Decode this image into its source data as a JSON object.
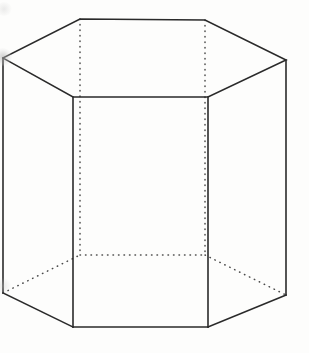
{
  "figure": {
    "background_color": "#fdfdfc",
    "solid_line_color": "#2a2a2a",
    "hidden_line_color": "#4a4a4a",
    "solid_line_width": 1.6,
    "hidden_line_width": 1.5,
    "hidden_dash_pattern": "0.5 5",
    "canvas": {
      "width": 309,
      "height": 353
    },
    "vertices": {
      "top_left_far": [
        3,
        58
      ],
      "top_back_left": [
        80,
        19
      ],
      "top_back_right": [
        205,
        20
      ],
      "top_right_far": [
        286,
        60
      ],
      "top_front_right": [
        208,
        97
      ],
      "top_front_left": [
        73,
        97
      ],
      "bottom_left_far": [
        3,
        293
      ],
      "bottom_back_left": [
        80,
        255
      ],
      "bottom_back_right": [
        205,
        255
      ],
      "bottom_right_far": [
        286,
        295
      ],
      "bottom_front_right": [
        208,
        327
      ],
      "bottom_front_left": [
        73,
        327
      ]
    },
    "edges": {
      "top_face_solid": "3,58 80,19 205,20 286,60 208,97 73,97 3,58",
      "bottom_front_solid": "73,327 208,327",
      "bottom_left_solid": "3,293 73,327",
      "bottom_right_solid": "208,327 286,295",
      "vertical_left_far_solid": "3,58 3,293",
      "vertical_front_left_solid": "73,97 73,327",
      "vertical_front_right_solid": "208,97 208,327",
      "vertical_right_far_solid": "286,60 286,295",
      "vertical_back_left_hidden": "80,19 80,255",
      "vertical_back_right_hidden": "205,20 205,255",
      "bottom_back_edge_hidden": "80,255 205,255",
      "bottom_back_left_diag_hidden": "3,293 80,255",
      "bottom_back_right_diag_hidden": "205,255 286,295"
    },
    "artifacts": [
      {
        "name": "smudge-left-vertex"
      },
      {
        "name": "smudge-upper-left"
      },
      {
        "name": "smudge-lower-left"
      }
    ]
  }
}
